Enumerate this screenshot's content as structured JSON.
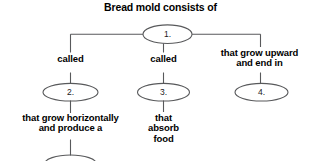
{
  "diagram": {
    "title": "Bread mold consists of",
    "background_color": "#ffffff",
    "line_color": "#58595b",
    "text_color": "#000000",
    "nodes": [
      {
        "id": "n1",
        "label": "1.",
        "shape": "ellipse"
      },
      {
        "id": "n2",
        "label": "2.",
        "shape": "ellipse"
      },
      {
        "id": "n3",
        "label": "3.",
        "shape": "ellipse"
      },
      {
        "id": "n4",
        "label": "4.",
        "shape": "ellipse"
      },
      {
        "id": "n5",
        "label": "",
        "shape": "ellipse-partial"
      }
    ],
    "edge_labels": [
      {
        "id": "e1",
        "text": "called"
      },
      {
        "id": "e2",
        "text": "called"
      },
      {
        "id": "e3",
        "text": "that grow upward\nand end in"
      },
      {
        "id": "e4",
        "text": "that grow horizontally\nand produce a"
      },
      {
        "id": "e5",
        "text": "that\nabsorb\nfood"
      }
    ]
  }
}
